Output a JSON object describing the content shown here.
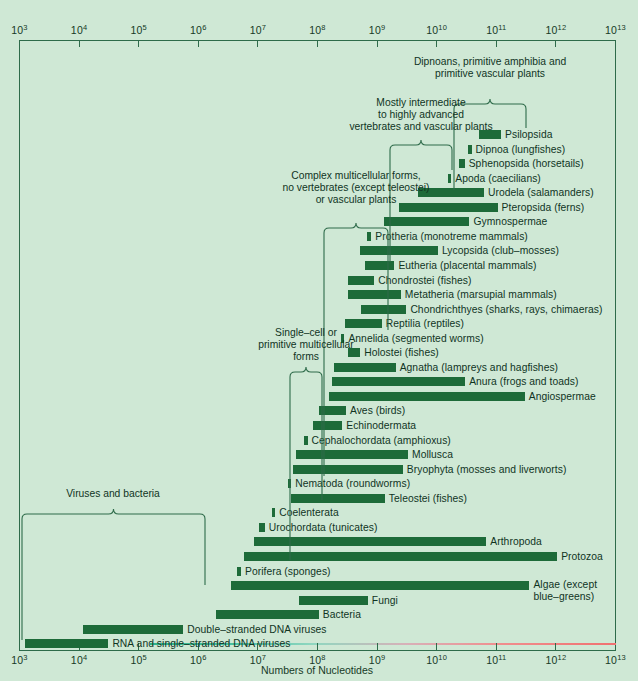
{
  "chart_data": {
    "type": "bar",
    "orientation": "horizontal",
    "title": "",
    "xlabel": "Numbers of Nucleotides",
    "ylabel": "",
    "xscale": "log",
    "xlim": [
      1000,
      10000000000000
    ],
    "grid": false,
    "legend": "none",
    "tick_labels": [
      "10³",
      "10⁴",
      "10⁵",
      "10⁶",
      "10⁷",
      "10⁸",
      "10⁹",
      "10¹⁰",
      "10¹¹",
      "10¹²",
      "10¹³"
    ],
    "tick_mantissa": [
      "10",
      "10",
      "10",
      "10",
      "10",
      "10",
      "10",
      "10",
      "10",
      "10",
      "10"
    ],
    "tick_exponents": [
      "3",
      "4",
      "5",
      "6",
      "7",
      "8",
      "9",
      "10",
      "11",
      "12",
      "13"
    ],
    "bar_color": "#1d6b39",
    "frame_color": "#2e6b4a",
    "background_color": "#cfe8d5",
    "bars": [
      {
        "label": "Psilopsida",
        "x0": 50500000000.0,
        "x1": 120000000000.0,
        "label_side": "right"
      },
      {
        "label": "Dipnoa (lungfishes)",
        "x0": 33000000000.0,
        "x1": 38500000000.0,
        "label_side": "right"
      },
      {
        "label": "Sphenopsida (horsetails)",
        "x0": 24000000000.0,
        "x1": 29500000000.0,
        "label_side": "right"
      },
      {
        "label": "Apoda (caecilians)",
        "x0": 15500000000.0,
        "x1": 17200000000.0,
        "label_side": "right"
      },
      {
        "label": "Urodela (salamanders)",
        "x0": 4900000000.0,
        "x1": 62000000000.0,
        "label_side": "right"
      },
      {
        "label": "Pteropsida (ferns)",
        "x0": 2300000000.0,
        "x1": 105000000000.0,
        "label_side": "right"
      },
      {
        "label": "Gymnospermae",
        "x0": 1300000000.0,
        "x1": 35500000000.0,
        "label_side": "right"
      },
      {
        "label": "Protheria (monotreme mammals)",
        "x0": 680000000.0,
        "x1": 800000000.0,
        "label_side": "right"
      },
      {
        "label": "Lycopsida (club–mosses)",
        "x0": 520000000.0,
        "x1": 10500000000.0,
        "label_side": "right"
      },
      {
        "label": "Eutheria (placental mammals)",
        "x0": 630000000.0,
        "x1": 1950000000.0,
        "label_side": "right"
      },
      {
        "label": "Chondrostei (fishes)",
        "x0": 320000000.0,
        "x1": 900000000.0,
        "label_side": "right"
      },
      {
        "label": "Metatheria (marsupial mammals)",
        "x0": 320000000.0,
        "x1": 2500000000.0,
        "label_side": "right"
      },
      {
        "label": "Chondrichthyes (sharks, rays, chimaeras)",
        "x0": 540000000.0,
        "x1": 3100000000.0,
        "label_side": "right"
      },
      {
        "label": "Reptilia (reptiles)",
        "x0": 290000000.0,
        "x1": 1200000000.0,
        "label_side": "right"
      },
      {
        "label": "Annelida (segmented worms)",
        "x0": 250000000.0,
        "x1": 280000000.0,
        "label_side": "right"
      },
      {
        "label": "Holostei (fishes)",
        "x0": 320000000.0,
        "x1": 520000000.0,
        "label_side": "right"
      },
      {
        "label": "Agnatha (lampreys and hagfishes)",
        "x0": 190000000.0,
        "x1": 2050000000.0,
        "label_side": "right"
      },
      {
        "label": "Anura (frogs and toads)",
        "x0": 175000000.0,
        "x1": 30000000000.0,
        "label_side": "right"
      },
      {
        "label": "Angiospermae",
        "x0": 155000000.0,
        "x1": 300000000000.0,
        "label_side": "right"
      },
      {
        "label": "Aves (birds)",
        "x0": 105000000.0,
        "x1": 300000000.0,
        "label_side": "right"
      },
      {
        "label": "Echinodermata",
        "x0": 85000000.0,
        "x1": 260000000.0,
        "label_side": "right"
      },
      {
        "label": "Cephalochordata (amphioxus)",
        "x0": 60000000.0,
        "x1": 68000000.0,
        "label_side": "right"
      },
      {
        "label": "Mollusca",
        "x0": 43000000.0,
        "x1": 3300000000.0,
        "label_side": "right"
      },
      {
        "label": "Bryophyta (mosses and liverworts)",
        "x0": 39000000.0,
        "x1": 2700000000.0,
        "label_side": "right"
      },
      {
        "label": "Nematoda (roundworms)",
        "x0": 32000000.0,
        "x1": 36000000.0,
        "label_side": "right"
      },
      {
        "label": "Teleostei (fishes)",
        "x0": 36000000.0,
        "x1": 1350000000.0,
        "label_side": "right"
      },
      {
        "label": "Coelenterata",
        "x0": 17000000.0,
        "x1": 19500000.0,
        "label_side": "right"
      },
      {
        "label": "Urochordata (tunicates)",
        "x0": 10500000.0,
        "x1": 13000000.0,
        "label_side": "right"
      },
      {
        "label": "Arthropoda",
        "x0": 8500000.0,
        "x1": 68000000000.0,
        "label_side": "right"
      },
      {
        "label": "Protozoa",
        "x0": 5800000.0,
        "x1": 1050000000000.0,
        "label_side": "right"
      },
      {
        "label": "Porifera (sponges)",
        "x0": 4500000.0,
        "x1": 5200000.0,
        "label_side": "right"
      },
      {
        "label": "Algae (except\nblue–greens)",
        "x0": 3500000.0,
        "x1": 360000000000.0,
        "label_side": "right",
        "two_line": true
      },
      {
        "label": "Fungi",
        "x0": 48000000.0,
        "x1": 700000000.0,
        "label_side": "right"
      },
      {
        "label": "Bacteria",
        "x0": 1950000.0,
        "x1": 105000000.0,
        "label_side": "right"
      },
      {
        "label": "Double–stranded DNA viruses",
        "x0": 11500.0,
        "x1": 560000.0,
        "label_side": "right"
      },
      {
        "label": "RNA and single–stranded DNA viruses",
        "x0": 1250.0,
        "x1": 31000.0,
        "label_side": "right"
      }
    ],
    "groups": [
      {
        "caption": "Dipnoans, primitive amphibia and\nprimitive vascular plants",
        "lines": [
          "Dipnoans, primitive amphibia and",
          "primitive vascular plants"
        ]
      },
      {
        "caption": "Mostly intermediate\nto highly advanced\nvertebrates and vascular plants",
        "lines": [
          "Mostly intermediate",
          "to highly advanced",
          "vertebrates and vascular plants"
        ]
      },
      {
        "caption": "Complex multicellular forms,\nno vertebrates (except teleostei)\nor vascular plants",
        "lines": [
          "Complex multicellular forms,",
          "no vertebrates (except teleostei)",
          "or vascular plants"
        ]
      },
      {
        "caption": "Single-cell or\nprimitive multicellular\nforms",
        "lines": [
          "Single–cell or",
          "primitive multicellular",
          "forms"
        ]
      },
      {
        "caption": "Viruses and bacteria",
        "lines": [
          "Viruses and bacteria"
        ]
      }
    ]
  }
}
